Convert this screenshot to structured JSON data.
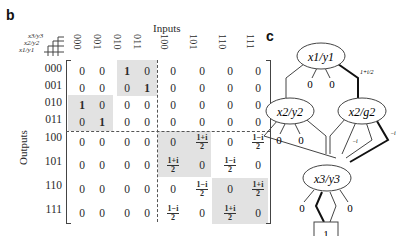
{
  "panels": {
    "b": {
      "label": "b",
      "inputs_title": "Inputs",
      "outputs_title": "Outputs",
      "corner_labels": [
        "x3/y3",
        "x2/y2",
        "x1/y1"
      ],
      "column_headers": [
        "000",
        "001",
        "010",
        "011",
        "100",
        "101",
        "110",
        "111"
      ],
      "row_headers": [
        "000",
        "001",
        "010",
        "011",
        "100",
        "101",
        "110",
        "111"
      ],
      "matrix": [
        [
          "0",
          "0",
          "1",
          "0",
          "0",
          "0",
          "0",
          "0"
        ],
        [
          "0",
          "0",
          "0",
          "1",
          "0",
          "0",
          "0",
          "0"
        ],
        [
          "1",
          "0",
          "0",
          "0",
          "0",
          "0",
          "0",
          "0"
        ],
        [
          "0",
          "1",
          "0",
          "0",
          "0",
          "0",
          "0",
          "0"
        ],
        [
          "0",
          "0",
          "0",
          "0",
          "0",
          "(1+i)/2",
          "0",
          "(1-i)/2"
        ],
        [
          "0",
          "0",
          "0",
          "0",
          "(1+i)/2",
          "0",
          "(1-i)/2",
          "0"
        ],
        [
          "0",
          "0",
          "0",
          "0",
          "0",
          "(1-i)/2",
          "0",
          "(1+i)/2"
        ],
        [
          "0",
          "0",
          "0",
          "0",
          "(1-i)/2",
          "0",
          "(1+i)/2",
          "0"
        ]
      ],
      "fractions": {
        "plus": {
          "num": "1+i",
          "den": "2"
        },
        "minus": {
          "num": "1−i",
          "den": "2"
        }
      }
    },
    "c": {
      "label": "c",
      "nodes": {
        "top": "x1/y1",
        "left": "x2/y2",
        "right": "x2/g2",
        "bottom": "x3/y3",
        "terminal": "1"
      },
      "edge_labels": {
        "top_zero_left": "0",
        "top_zero_right": "0",
        "top_weight": "1+i/2",
        "left_zero_a": "0",
        "left_zero_b": "0",
        "right_inner": "−i",
        "right_outer": "−i",
        "bottom_zero_left": "0",
        "bottom_zero_right": "0"
      }
    }
  },
  "colors": {
    "shade": "#e2e2e2",
    "text": "#2a2a2a",
    "line": "#444444",
    "bold_line": "#111111"
  }
}
